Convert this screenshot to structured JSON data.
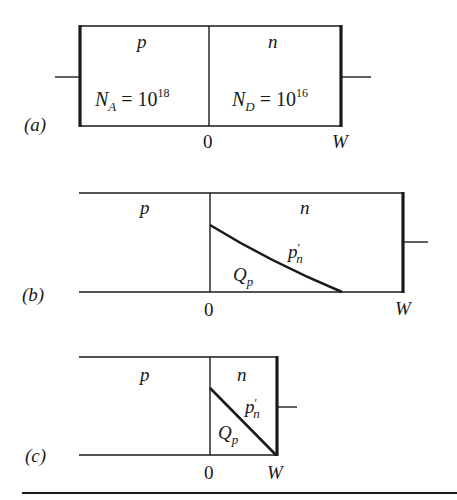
{
  "figure": {
    "panels": [
      {
        "id": "a",
        "label": "(a)",
        "region_p": "p",
        "region_n": "n",
        "doping_p": {
          "symbol": "N",
          "sub": "A",
          "eq": " = 10",
          "exp": "18"
        },
        "doping_n": {
          "symbol": "N",
          "sub": "D",
          "eq": " = 10",
          "exp": "16"
        },
        "axis_origin": "0",
        "axis_end": "W"
      },
      {
        "id": "b",
        "label": "(b)",
        "region_p": "p",
        "region_n": "n",
        "curve_label": {
          "symbol": "p",
          "prime": "′",
          "sub": "n"
        },
        "area_label": {
          "symbol": "Q",
          "sub": "p"
        },
        "axis_origin": "0",
        "axis_end": "W"
      },
      {
        "id": "c",
        "label": "(c)",
        "region_p": "p",
        "region_n": "n",
        "curve_label": {
          "symbol": "p",
          "prime": "′",
          "sub": "n"
        },
        "area_label": {
          "symbol": "Q",
          "sub": "p"
        },
        "axis_origin": "0",
        "axis_end": "W"
      }
    ]
  }
}
